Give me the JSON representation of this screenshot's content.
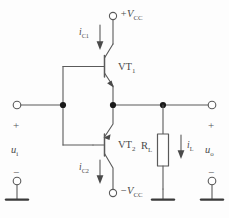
{
  "diagram": {
    "type": "complementary-push-pull-emitter-follower",
    "title_visible": false,
    "stroke_color": "#5a5a5a",
    "node_color": "#1a1a1a",
    "text_color": "#4a4a4a",
    "background": "#fdfdfd"
  },
  "supplies": {
    "positive": {
      "label_main": "+V",
      "label_sub": "CC",
      "terminal": "open-circle"
    },
    "negative": {
      "label_main": "−V",
      "label_sub": "CC",
      "terminal": "open-circle"
    }
  },
  "currents": [
    {
      "id": "ic1",
      "label_main": "i",
      "label_sub": "C1",
      "direction": "down"
    },
    {
      "id": "ic2",
      "label_main": "i",
      "label_sub": "C2",
      "direction": "down"
    },
    {
      "id": "il",
      "label_main": "i",
      "label_sub": "L",
      "direction": "down"
    }
  ],
  "transistors": [
    {
      "id": "vt1",
      "label_main": "VT",
      "label_sub": "1",
      "kind": "NPN",
      "position": "upper"
    },
    {
      "id": "vt2",
      "label_main": "VT",
      "label_sub": "2",
      "kind": "PNP",
      "position": "lower"
    }
  ],
  "resistor": {
    "label_main": "R",
    "label_sub": "L"
  },
  "ports": {
    "input": {
      "signal_main": "u",
      "signal_sub": "i",
      "plus": "+",
      "minus": "−",
      "terminal": "open-circle"
    },
    "output": {
      "signal_main": "u",
      "signal_sub": "o",
      "plus": "+",
      "minus": "−",
      "terminal": "open-circle"
    }
  },
  "grounds": [
    {
      "id": "ground-left",
      "style": "bar"
    },
    {
      "id": "ground-middle",
      "style": "bar"
    },
    {
      "id": "ground-right",
      "style": "bar"
    }
  ]
}
